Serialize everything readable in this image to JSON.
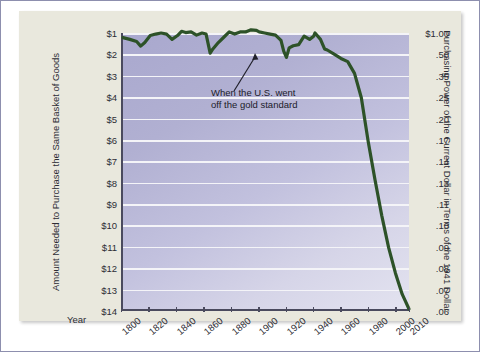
{
  "figure": {
    "background_color": "#e9e8dd",
    "plot_background_colors": [
      "#a9a8ce",
      "#e3e3f0"
    ],
    "series_color": "#2d5228",
    "frame_color": "#8d8fae"
  },
  "axes": {
    "x_label": "Year",
    "y_left_title": "Amount Needed to Purchase the Same Basket of Goods",
    "y_right_title": "Purchasing Power of the Current Dollar in Terms of the 1941 Dollar",
    "y_left_ticks": [
      "$1",
      "$2",
      "$3",
      "$4",
      "$5",
      "$6",
      "$7",
      "$8",
      "$9",
      "$10",
      "$11",
      "$12",
      "$13",
      "$14"
    ],
    "y_right_ticks": [
      "$1.00",
      ".50",
      ".35",
      ".25",
      ".20",
      ".17",
      ".14",
      ".13",
      ".11",
      ".10",
      ".09",
      ".08",
      ".07",
      ".06"
    ],
    "x_ticks": [
      "1800",
      "1820",
      "1840",
      "1860",
      "1880",
      "1900",
      "1920",
      "1940",
      "1960",
      "1980",
      "2000",
      "2010"
    ]
  },
  "annotation": {
    "line1": "When the U.S. went",
    "line2": "off the gold standard",
    "points_to_year": 1933
  },
  "chart_data": {
    "type": "line",
    "title": "",
    "xlabel": "Year",
    "ylabel": "Amount Needed to Purchase the Same Basket of Goods",
    "ylabel_secondary": "Purchasing Power of the Current Dollar in Terms of the 1941 Dollar",
    "xlim": [
      1800,
      2010
    ],
    "ylim": [
      1,
      14
    ],
    "y_inverted": true,
    "grid": true,
    "legend": "none",
    "y_left_tick_values": [
      1,
      2,
      3,
      4,
      5,
      6,
      7,
      8,
      9,
      10,
      11,
      12,
      13,
      14
    ],
    "y_right_tick_values": [
      1.0,
      0.5,
      0.35,
      0.25,
      0.2,
      0.17,
      0.14,
      0.13,
      0.11,
      0.1,
      0.09,
      0.08,
      0.07,
      0.06
    ],
    "x_tick_values": [
      1800,
      1820,
      1840,
      1860,
      1880,
      1900,
      1920,
      1940,
      1960,
      1980,
      2000,
      2010
    ],
    "series": [
      {
        "name": "Amount needed to purchase the same basket of goods",
        "color": "#2d5228",
        "x": [
          1800,
          1805,
          1810,
          1813,
          1816,
          1820,
          1824,
          1828,
          1832,
          1836,
          1840,
          1843,
          1846,
          1850,
          1854,
          1858,
          1861,
          1864,
          1866,
          1870,
          1874,
          1878,
          1882,
          1886,
          1890,
          1894,
          1898,
          1900,
          1904,
          1908,
          1912,
          1916,
          1918,
          1920,
          1922,
          1925,
          1929,
          1933,
          1937,
          1940,
          1941,
          1945,
          1948,
          1950,
          1955,
          1960,
          1965,
          1970,
          1975,
          1980,
          1985,
          1990,
          1995,
          2000,
          2005,
          2010
        ],
        "y": [
          1.22,
          1.3,
          1.4,
          1.62,
          1.45,
          1.12,
          1.05,
          1.0,
          1.05,
          1.3,
          1.12,
          0.92,
          0.98,
          0.95,
          1.1,
          1.0,
          1.05,
          1.95,
          1.75,
          1.45,
          1.2,
          0.95,
          1.05,
          0.95,
          0.95,
          0.85,
          0.88,
          0.95,
          1.0,
          1.05,
          1.1,
          1.35,
          1.85,
          2.15,
          1.7,
          1.6,
          1.55,
          1.15,
          1.3,
          1.15,
          1.0,
          1.3,
          1.75,
          1.8,
          2.0,
          2.2,
          2.35,
          2.9,
          4.05,
          6.1,
          7.9,
          9.6,
          11.1,
          12.3,
          13.3,
          14.0
        ],
        "y_purchasing_power": [
          0.82,
          0.77,
          0.71,
          0.62,
          0.69,
          0.89,
          0.95,
          1.0,
          0.95,
          0.77,
          0.89,
          1.09,
          1.02,
          1.05,
          0.91,
          1.0,
          0.95,
          0.51,
          0.57,
          0.69,
          0.83,
          1.05,
          0.95,
          1.05,
          1.05,
          1.18,
          1.14,
          1.05,
          1.0,
          0.95,
          0.91,
          0.74,
          0.54,
          0.47,
          0.59,
          0.63,
          0.65,
          0.87,
          0.77,
          0.87,
          1.0,
          0.77,
          0.57,
          0.56,
          0.5,
          0.45,
          0.43,
          0.34,
          0.25,
          0.16,
          0.13,
          0.1,
          0.09,
          0.08,
          0.075,
          0.06
        ]
      }
    ],
    "annotations": [
      {
        "text": "When the U.S. went off the gold standard",
        "x": 1933,
        "y": 1.15
      }
    ]
  }
}
